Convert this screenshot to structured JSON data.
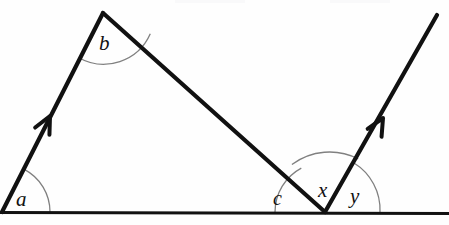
{
  "figure": {
    "type": "geometry-diagram",
    "background_color": "#fefefe",
    "stroke_color": "#111111",
    "arc_color": "#7a7a7a",
    "canvas": {
      "width": 449,
      "height": 225
    }
  },
  "labels": {
    "a": "a",
    "b": "b",
    "c": "c",
    "x": "x",
    "y": "y"
  },
  "points": {
    "left_vertex": {
      "x": 2,
      "y": 212
    },
    "apex": {
      "x": 103,
      "y": 13
    },
    "right_vertex": {
      "x": 325,
      "y": 212
    },
    "right_ray_end": {
      "x": 437,
      "y": 15
    },
    "baseline_left": {
      "x": 0,
      "y": 212
    },
    "baseline_right": {
      "x": 449,
      "y": 212
    }
  },
  "segments": [
    {
      "name": "baseline",
      "from": "baseline_left",
      "to": "baseline_right",
      "width": 3.2
    },
    {
      "name": "left-parallel-ray",
      "from": "left_vertex",
      "to": "apex",
      "width": 4.2,
      "arrow": true
    },
    {
      "name": "transversal",
      "from": "apex",
      "to": "right_vertex",
      "width": 4.2,
      "arrow": false
    },
    {
      "name": "right-parallel-ray",
      "from": "right_vertex",
      "to": "right_ray_end",
      "width": 4.2,
      "arrow": true
    }
  ],
  "arrow_marks": [
    {
      "name": "left-ray-arrowhead",
      "x": 50,
      "y": 116
    },
    {
      "name": "right-ray-arrowhead",
      "x": 383,
      "y": 118
    }
  ],
  "angle_arcs": [
    {
      "name": "angle-a-arc",
      "vertex": "left_vertex",
      "radius": 48,
      "label": "a"
    },
    {
      "name": "angle-b-arc",
      "vertex": "apex",
      "radius": 51,
      "label": "b"
    },
    {
      "name": "angle-c-arc",
      "vertex": "right_vertex",
      "radius": 50,
      "label": "c"
    },
    {
      "name": "angle-x-arc",
      "vertex": "right_vertex",
      "radius": 63,
      "label": "x"
    },
    {
      "name": "angle-y-arc",
      "vertex": "right_vertex",
      "radius": 55,
      "label": "y"
    }
  ]
}
